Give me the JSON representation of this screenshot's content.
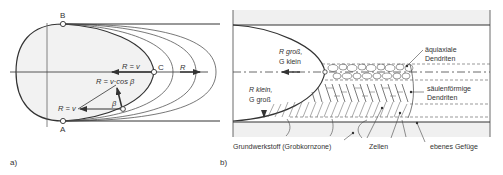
{
  "panel_a": {
    "label": "a)",
    "points": {
      "B": "B",
      "A": "A",
      "C": "C"
    },
    "labels": {
      "r_eq_v_top": "R = v",
      "r_eq_vcos": "R = v·cos β",
      "r_eq_v_bottom": "R = v",
      "beta": "β",
      "r": "R"
    }
  },
  "panel_b": {
    "label": "b)",
    "labels": {
      "r_gross_line1": "R groß,",
      "r_gross_line2": "G klein",
      "r_klein_line1": "R klein,",
      "r_klein_line2": "G groß",
      "aequiaxiale_1": "äquiaxiale",
      "aequiaxiale_2": "Dendriten",
      "saeulen_1": "säulenförmige",
      "saeulen_2": "Dendriten",
      "grundwerkstoff": "Grundwerkstoff (Grobkornzone)",
      "zellen": "Zellen",
      "ebenes": "ebenes Gefüge"
    }
  },
  "colors": {
    "line": "#333333",
    "fill": "#f2f2f2",
    "band": "#f0f0f0",
    "text": "#333333"
  }
}
